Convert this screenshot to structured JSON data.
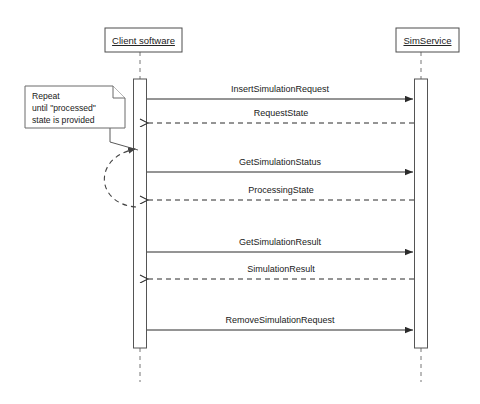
{
  "diagram": {
    "type": "uml-sequence-diagram",
    "background_color": "#ffffff",
    "line_color": "#2b2b2b",
    "participants": [
      {
        "id": "client",
        "label": "Client software",
        "x": 140
      },
      {
        "id": "service",
        "label": "SimService",
        "x": 421
      }
    ],
    "note": {
      "lines": [
        "Repeat",
        "until \"processed\"",
        "state is provided"
      ],
      "line1": "Repeat",
      "line2": "until \"processed\"",
      "line3": "state is provided"
    },
    "messages": [
      {
        "index": 0,
        "label": "InsertSimulationRequest",
        "from": "client",
        "to": "service",
        "style": "solid",
        "direction": "right",
        "y": 99
      },
      {
        "index": 1,
        "label": "RequestState",
        "from": "service",
        "to": "client",
        "style": "dashed",
        "direction": "left",
        "y": 123
      },
      {
        "index": 2,
        "label": "GetSimulationStatus",
        "from": "client",
        "to": "service",
        "style": "solid",
        "direction": "right",
        "y": 172
      },
      {
        "index": 3,
        "label": "ProcessingState",
        "from": "service",
        "to": "client",
        "style": "dashed",
        "direction": "left",
        "y": 200
      },
      {
        "index": 4,
        "label": "GetSimulationResult",
        "from": "client",
        "to": "service",
        "style": "solid",
        "direction": "right",
        "y": 252
      },
      {
        "index": 5,
        "label": "SimulationResult",
        "from": "service",
        "to": "client",
        "style": "dashed",
        "direction": "left",
        "y": 279
      },
      {
        "index": 6,
        "label": "RemoveSimulationRequest",
        "from": "client",
        "to": "service",
        "style": "solid",
        "direction": "right",
        "y": 330
      }
    ],
    "loop": {
      "label": "repeat-loop",
      "style": "dashed-curved-arrow",
      "from_y": 207,
      "to_y": 147
    }
  }
}
